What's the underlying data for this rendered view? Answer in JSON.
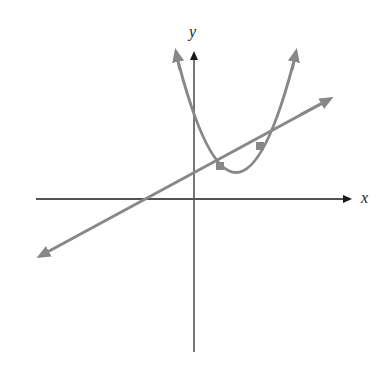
{
  "diagram": {
    "title": "",
    "axes": {
      "x_label": "x",
      "y_label": "y",
      "axis_color": "#1a1a1a"
    },
    "curves": [
      {
        "name": "parabola",
        "type": "parabola",
        "color": "#888888",
        "description": "upward-opening parabola with vertex in first quadrant, positive y-intercept"
      },
      {
        "name": "line",
        "type": "line",
        "color": "#888888",
        "description": "line with positive slope and positive y-intercept"
      }
    ],
    "intersection_points": [
      {
        "label": "",
        "x_px": 220,
        "y_px": 166
      },
      {
        "label": "",
        "x_px": 260,
        "y_px": 146
      }
    ]
  }
}
